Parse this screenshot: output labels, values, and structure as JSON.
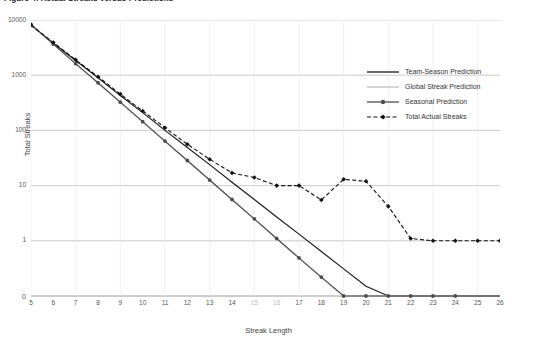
{
  "figure": {
    "caption": "Figure 4: Actual Streaks versus Predictions"
  },
  "chart_data": {
    "type": "line",
    "title": "Figure 4: Actual Streaks versus Predictions",
    "xlabel": "Streak Length",
    "ylabel": "Total Streaks",
    "yscale": "log",
    "grid": true,
    "legend_position": "right",
    "xlim": [
      5,
      26
    ],
    "ylim": [
      0,
      10000
    ],
    "ytick_labels": [
      "10000",
      "1000",
      "100",
      "10",
      "1",
      "0"
    ],
    "ytick_values": [
      10000,
      1000,
      100,
      10,
      1,
      0
    ],
    "xtick_labels": [
      "5",
      "6",
      "7",
      "8",
      "9",
      "10",
      "11",
      "12",
      "13",
      "14",
      "15",
      "16",
      "17",
      "18",
      "19",
      "20",
      "21",
      "22",
      "23",
      "24",
      "25",
      "26"
    ],
    "x": [
      5,
      6,
      7,
      8,
      9,
      10,
      11,
      12,
      13,
      14,
      15,
      16,
      17,
      18,
      19,
      20,
      21,
      22,
      23,
      24,
      25,
      26
    ],
    "series": [
      {
        "name": "Team-Season Prediction",
        "style": "solid",
        "color": "#1a1a1a",
        "marker": "none",
        "values": [
          8000,
          3800,
          1850,
          900,
          430,
          210,
          100,
          49,
          24,
          11.5,
          5.6,
          2.7,
          1.32,
          0.64,
          0.31,
          0.15,
          0.073,
          0.035,
          0.017,
          0.0083,
          0.004,
          0.0019
        ]
      },
      {
        "name": "Global Streak Prediction",
        "style": "solid",
        "color": "#bfbfbf",
        "marker": "none",
        "values": [
          8200,
          3600,
          1600,
          720,
          320,
          142,
          63,
          28,
          12.4,
          5.5,
          2.45,
          1.09,
          0.48,
          0.215,
          0.095,
          0.042,
          0.019,
          0.0083,
          0.0037,
          0.0016,
          null,
          null
        ]
      },
      {
        "name": "Seasonal Prediction",
        "style": "solid-marker",
        "color": "#4d4d4d",
        "marker": "circle",
        "values": [
          8300,
          3650,
          1620,
          730,
          325,
          144,
          64,
          28.5,
          12.6,
          5.6,
          2.5,
          1.1,
          0.49,
          0.22,
          0.097,
          0.043,
          0.019,
          0.0085,
          0.0038,
          0.0017,
          null,
          null
        ]
      },
      {
        "name": "Total Actual Streaks",
        "style": "dashed",
        "color": "#111111",
        "marker": "diamond",
        "values": [
          8100,
          3900,
          1900,
          940,
          455,
          225,
          112,
          56,
          30,
          17,
          14,
          10,
          10,
          5.5,
          13,
          12,
          4.2,
          1.1,
          1,
          1,
          1,
          1
        ]
      }
    ],
    "legend_entries": [
      {
        "label": "Team-Season Prediction",
        "color": "#1a1a1a",
        "style": "solid",
        "marker": "none"
      },
      {
        "label": "Global Streak Prediction",
        "color": "#bfbfbf",
        "style": "solid",
        "marker": "none"
      },
      {
        "label": "Seasonal Prediction",
        "color": "#4d4d4d",
        "style": "solid",
        "marker": "circle"
      },
      {
        "label": "Total Actual Streaks",
        "color": "#111111",
        "style": "dashed",
        "marker": "diamond"
      }
    ]
  }
}
